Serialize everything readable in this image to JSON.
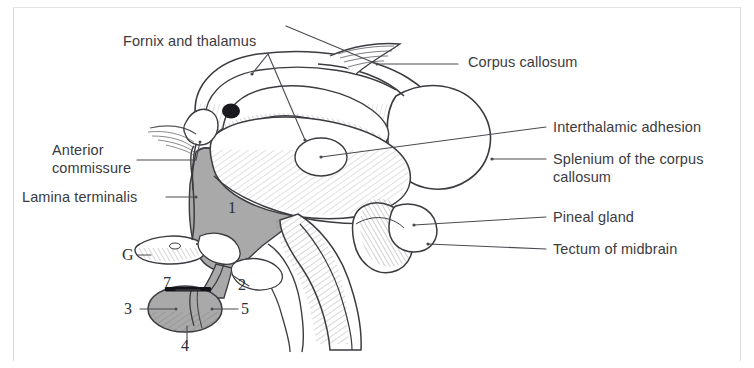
{
  "figure": {
    "background_color": "#ffffff",
    "frame_color": "#d9d9d9",
    "ink_color": "#3b3b40",
    "shade_color": "#a9a9a9",
    "leader_color": "#4a4a50"
  },
  "labels": {
    "fornix_and_thalamus": "Fornix and thalamus",
    "corpus_callosum": "Corpus callosum",
    "interthalamic_adhesion": "Interthalamic adhesion",
    "splenium_line1": "Splenium of the corpus",
    "splenium_line2": "callosum",
    "pineal_gland": "Pineal gland",
    "tectum_of_midbrain": "Tectum of midbrain",
    "anterior_line1": "Anterior",
    "anterior_line2": "commissure",
    "lamina_terminalis": "Lamina terminalis"
  },
  "callouts": {
    "g": "G",
    "one": "1",
    "two": "2",
    "three": "3",
    "four": "4",
    "five": "5",
    "seven": "7"
  },
  "caption": {
    "footer_text": ""
  }
}
